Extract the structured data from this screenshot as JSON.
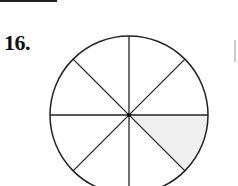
{
  "problem": {
    "number_label": "16."
  },
  "diagram": {
    "shape": "circle",
    "divisions": 8,
    "shaded_sections": 1,
    "shaded_position": "lower-right, between 0° and -45°",
    "shade_color": "#efefef",
    "line_color": "#222222"
  }
}
